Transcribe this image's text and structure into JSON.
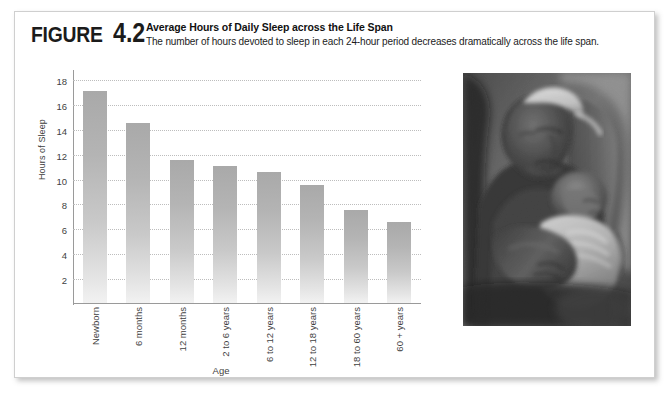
{
  "figure": {
    "label_word": "Figure",
    "label_number": "4.2",
    "title": "Average Hours of Daily Sleep across the Life Span",
    "subtitle": "The number of hours devoted to sleep in each 24-hour period decreases dramatically across the life span."
  },
  "photo": {
    "caption_alt": "Black-and-white photograph of a man asleep in an armchair cradling a sleeping infant on his chest",
    "name": "sleeping-father-and-infant-photo"
  },
  "colors": {
    "bar_top": "#a9a9a9",
    "bar_bottom": "#f2f2f2",
    "axis": "#9a9a9a",
    "gridline": "#bdbdbd",
    "panel_border": "#cfcfcf",
    "text": "#1b1b1b"
  },
  "chart_data": {
    "type": "bar",
    "title": "Average Hours of Daily Sleep across the Life Span",
    "xlabel": "Age",
    "ylabel": "Hours of Sleep",
    "categories": [
      "Newborn",
      "6 months",
      "12 months",
      "2 to 6 years",
      "6 to 12 years",
      "12 to 18 years",
      "18 to 60 years",
      "60 + years"
    ],
    "values": [
      17,
      14.5,
      11.5,
      11,
      10.5,
      9.5,
      7.5,
      6.5
    ],
    "ylim": [
      0,
      18.8
    ],
    "yticks": [
      2,
      4,
      6,
      8,
      10,
      12,
      14,
      16,
      18
    ],
    "grid": true,
    "legend": false
  }
}
